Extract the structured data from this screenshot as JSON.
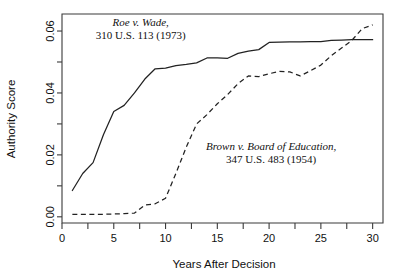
{
  "chart_data": {
    "type": "line",
    "title": "",
    "xlabel": "Years After Decision",
    "ylabel": "Authority Score",
    "xlim": [
      0,
      31
    ],
    "ylim": [
      -0.002,
      0.0655
    ],
    "grid": false,
    "legend_position": "inline-annotations",
    "x_ticks": [
      0,
      5,
      10,
      15,
      20,
      25,
      30
    ],
    "x_tick_labels": [
      "0",
      "5",
      "10",
      "15",
      "20",
      "25",
      "30"
    ],
    "x_minor_ticks": [
      2.5,
      7.5,
      12.5,
      17.5,
      22.5,
      27.5
    ],
    "y_ticks": [
      0.0,
      0.02,
      0.04,
      0.06
    ],
    "y_tick_labels": [
      "0.00",
      "0.02",
      "0.04",
      "0.06"
    ],
    "y_minor_ticks": [
      0.01,
      0.03,
      0.05
    ],
    "x": [
      1,
      2,
      3,
      4,
      5,
      6,
      7,
      8,
      9,
      10,
      11,
      12,
      13,
      14,
      15,
      16,
      17,
      18,
      19,
      20,
      21,
      22,
      23,
      24,
      25,
      26,
      27,
      28,
      29,
      30
    ],
    "series": [
      {
        "name": "Roe v. Wade, 310 U.S. 113 (1973)",
        "style": "solid",
        "values": [
          0.0085,
          0.014,
          0.0175,
          0.0265,
          0.034,
          0.036,
          0.04,
          0.0445,
          0.0478,
          0.048,
          0.0488,
          0.0492,
          0.0497,
          0.0513,
          0.0513,
          0.0512,
          0.0528,
          0.0535,
          0.054,
          0.0563,
          0.0564,
          0.0565,
          0.0565,
          0.0566,
          0.0566,
          0.057,
          0.0571,
          0.0572,
          0.0572,
          0.0572
        ]
      },
      {
        "name": "Brown v. Board of Education, 347 U.S. 483 (1954)",
        "style": "dashed",
        "values": [
          0.0008,
          0.0008,
          0.0008,
          0.0008,
          0.0009,
          0.001,
          0.0012,
          0.0038,
          0.0042,
          0.006,
          0.014,
          0.0225,
          0.03,
          0.033,
          0.0365,
          0.0395,
          0.043,
          0.0455,
          0.0453,
          0.0462,
          0.047,
          0.0468,
          0.0455,
          0.0472,
          0.049,
          0.052,
          0.0545,
          0.057,
          0.0608,
          0.062
        ]
      }
    ],
    "annotations": [
      {
        "name": "roe-v-wade-label",
        "line1": "Roe v. Wade,",
        "line2": "310 U.S. 113 (1973)",
        "x_data": 7.6,
        "y_data": 0.0615
      },
      {
        "name": "brown-v-board-label",
        "line1": "Brown v. Board of Education,",
        "line2": "347 U.S. 483 (1954)",
        "x_data": 20.2,
        "y_data": 0.0215
      }
    ],
    "colors": {
      "line": "#222222",
      "axis": "#3a3a3a",
      "text": "#111111",
      "background": "#ffffff"
    }
  }
}
